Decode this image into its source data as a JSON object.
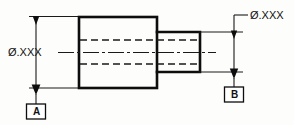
{
  "drawing": {
    "title": "Stepped shaft datum feature drawing",
    "background_color": "#fdfdfb",
    "line_color": "#0d0d0d",
    "dimensions": [
      {
        "id": "left",
        "label": "Ø.XXX",
        "datum": "A",
        "feature": "large-diameter-body",
        "orientation": "vertical"
      },
      {
        "id": "right",
        "label": "Ø.XXX",
        "datum": "B",
        "feature": "small-diameter-step",
        "orientation": "vertical"
      }
    ],
    "datum_symbols": [
      {
        "letter": "A",
        "position": "bottom-left"
      },
      {
        "letter": "B",
        "position": "bottom-right"
      }
    ],
    "features": {
      "body": {
        "name": "large-cylinder-body"
      },
      "step": {
        "name": "small-cylinder-step"
      },
      "bore": {
        "name": "hidden-bore-lines"
      },
      "axis": {
        "name": "center-axis-line"
      }
    }
  }
}
